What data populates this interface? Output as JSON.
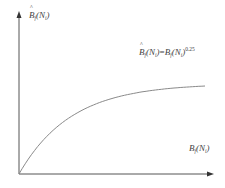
{
  "chart_data": {
    "type": "line",
    "title": "",
    "ylabel": "B̂_f(N_i)",
    "xlabel": "B_f(N_i)",
    "annotations": [
      "B̂_f(N_i) = B_f(N_i)^0.25"
    ],
    "series": [
      {
        "name": "B̂_f(N_i) = B_f(N_i)^0.25",
        "description": "concave curve starting at origin, rising steeply then flattening to a plateau",
        "x": [
          0,
          0.05,
          0.1,
          0.2,
          0.3,
          0.4,
          0.5,
          0.6,
          0.7,
          0.8,
          0.9,
          1.0
        ],
        "y": [
          0,
          0.27,
          0.43,
          0.63,
          0.75,
          0.83,
          0.89,
          0.93,
          0.96,
          0.98,
          0.99,
          1.0
        ]
      }
    ],
    "grid": false,
    "legend": "none",
    "axis_ticks": "none"
  },
  "labels": {
    "y_axis": {
      "base": "B",
      "sub1": "f",
      "mid": "(N",
      "sub2": "i",
      "end": ")"
    },
    "formula": {
      "lhs_base": "B",
      "lhs_sub1": "f",
      "lhs_mid": "(N",
      "lhs_sub2": "i",
      "lhs_end": ")",
      "eq": "=",
      "rhs_base": "B",
      "rhs_sub1": "f",
      "rhs_mid": "(N",
      "rhs_sub2": "i",
      "rhs_end": ")",
      "exp": "0.25"
    },
    "x_axis": {
      "base": "B",
      "sub1": "f",
      "mid": "(N",
      "sub2": "i",
      "end": ")"
    }
  },
  "colors": {
    "axis": "#555555",
    "curve": "#8a8a8a"
  }
}
